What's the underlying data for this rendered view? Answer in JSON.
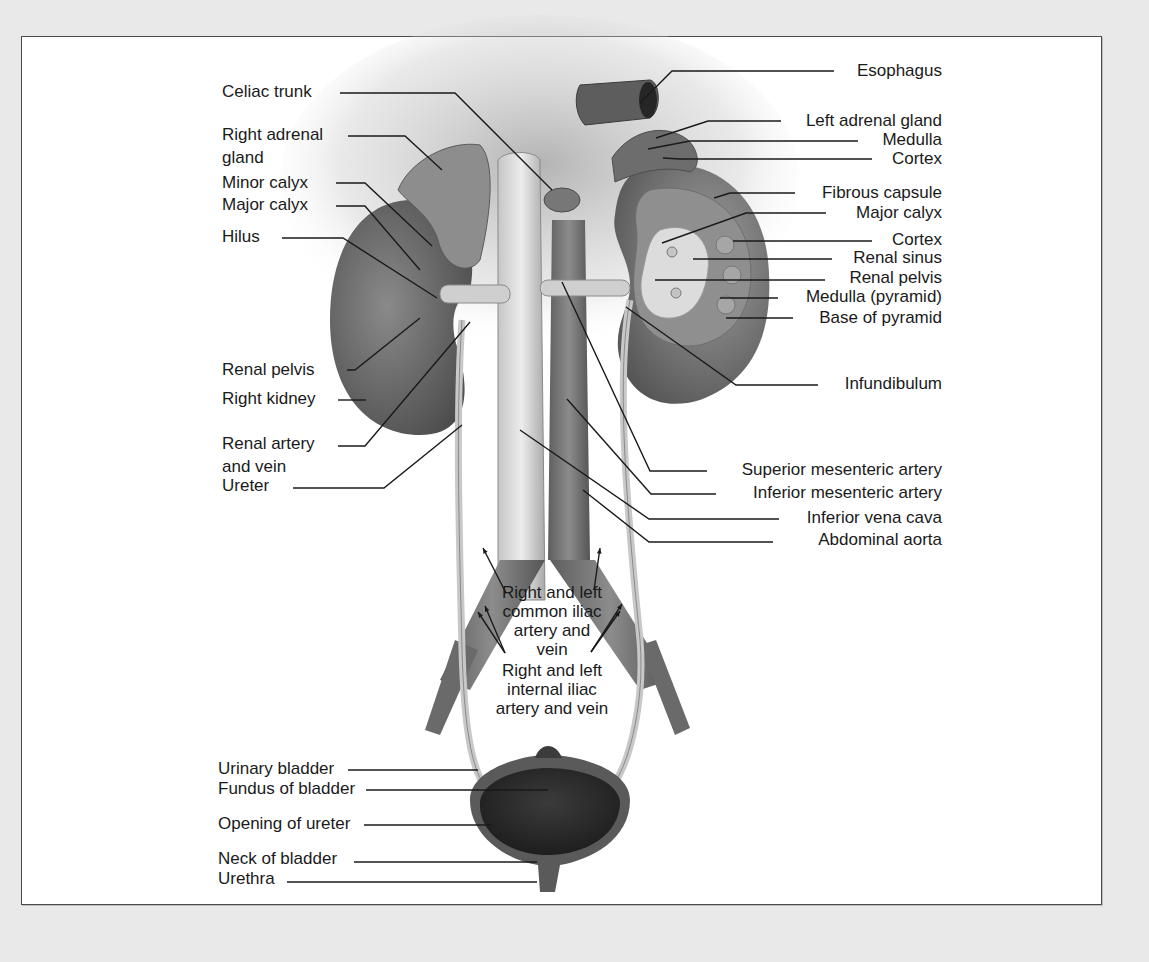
{
  "figure": {
    "colors": {
      "page_bg": "#e9e9e9",
      "frame_bg": "#ffffff",
      "frame_border": "#4a4a4a",
      "label_text": "#1a1a1a",
      "tissue_dark": "#4b4b4b",
      "tissue_mid": "#7a7a7a",
      "tissue_light": "#b9b9b9",
      "vessel_light": "#d6d6d6",
      "bladder_dark": "#2f2f2f"
    }
  },
  "labels_left": [
    {
      "id": "celiac-trunk",
      "text": "Celiac trunk",
      "x": 222,
      "y": 97,
      "line": [
        [
          340,
          93
        ],
        [
          455,
          93
        ],
        [
          552,
          190
        ]
      ]
    },
    {
      "id": "right-adrenal-gland",
      "text": "Right adrenal",
      "text2": "gland",
      "x": 222,
      "y": 140,
      "line": [
        [
          348,
          136
        ],
        [
          405,
          136
        ],
        [
          442,
          170
        ]
      ]
    },
    {
      "id": "minor-calyx",
      "text": "Minor calyx",
      "x": 222,
      "y": 188,
      "line": [
        [
          336,
          183
        ],
        [
          365,
          183
        ],
        [
          432,
          246
        ]
      ]
    },
    {
      "id": "major-calyx-right",
      "text": "Major calyx",
      "x": 222,
      "y": 210,
      "line": [
        [
          336,
          206
        ],
        [
          365,
          206
        ],
        [
          420,
          270
        ]
      ]
    },
    {
      "id": "hilus",
      "text": "Hilus",
      "x": 222,
      "y": 242,
      "line": [
        [
          282,
          238
        ],
        [
          343,
          238
        ],
        [
          437,
          298
        ]
      ]
    },
    {
      "id": "renal-pelvis-right",
      "text": "Renal pelvis",
      "x": 222,
      "y": 375,
      "line": [
        [
          347,
          370
        ],
        [
          355,
          370
        ],
        [
          420,
          318
        ]
      ]
    },
    {
      "id": "right-kidney",
      "text": "Right kidney",
      "x": 222,
      "y": 404,
      "line": [
        [
          338,
          400
        ],
        [
          366,
          400
        ]
      ]
    },
    {
      "id": "renal-artery-and-vein",
      "text": "Renal artery",
      "text2": "and vein",
      "x": 222,
      "y": 449,
      "line": [
        [
          338,
          446
        ],
        [
          365,
          446
        ],
        [
          470,
          322
        ]
      ]
    },
    {
      "id": "ureter",
      "text": "Ureter",
      "x": 222,
      "y": 491,
      "line": [
        [
          293,
          488
        ],
        [
          384,
          488
        ],
        [
          462,
          425
        ]
      ]
    }
  ],
  "labels_right": [
    {
      "id": "esophagus",
      "text": "Esophagus",
      "x": 942,
      "y": 76,
      "line": [
        [
          834,
          71
        ],
        [
          672,
          71
        ],
        [
          640,
          103
        ]
      ]
    },
    {
      "id": "left-adrenal-gland",
      "text": "Left adrenal gland",
      "x": 942,
      "y": 126,
      "line": [
        [
          781,
          121
        ],
        [
          708,
          121
        ],
        [
          656,
          138
        ]
      ]
    },
    {
      "id": "medulla-adrenal",
      "text": "Medulla",
      "x": 942,
      "y": 145,
      "line": [
        [
          858,
          141
        ],
        [
          690,
          141
        ],
        [
          648,
          149
        ]
      ]
    },
    {
      "id": "cortex-adrenal",
      "text": "Cortex",
      "x": 942,
      "y": 164,
      "line": [
        [
          872,
          159
        ],
        [
          680,
          159
        ],
        [
          663,
          158
        ]
      ]
    },
    {
      "id": "fibrous-capsule",
      "text": "Fibrous capsule",
      "x": 942,
      "y": 198,
      "line": [
        [
          795,
          193
        ],
        [
          730,
          193
        ],
        [
          714,
          198
        ]
      ]
    },
    {
      "id": "major-calyx-left",
      "text": "Major calyx",
      "x": 942,
      "y": 218,
      "line": [
        [
          826,
          213
        ],
        [
          746,
          213
        ],
        [
          662,
          243
        ]
      ]
    },
    {
      "id": "cortex-kidney",
      "text": "Cortex",
      "x": 942,
      "y": 245,
      "line": [
        [
          872,
          241
        ],
        [
          733,
          241
        ]
      ]
    },
    {
      "id": "renal-sinus",
      "text": "Renal sinus",
      "x": 942,
      "y": 263,
      "line": [
        [
          832,
          259
        ],
        [
          693,
          259
        ]
      ]
    },
    {
      "id": "renal-pelvis-left",
      "text": "Renal pelvis",
      "x": 942,
      "y": 283,
      "line": [
        [
          825,
          280
        ],
        [
          655,
          280
        ]
      ]
    },
    {
      "id": "medulla-pyramid",
      "text": "Medulla (pyramid)",
      "x": 942,
      "y": 302,
      "line": [
        [
          778,
          298
        ],
        [
          720,
          298
        ]
      ]
    },
    {
      "id": "base-of-pyramid",
      "text": "Base of pyramid",
      "x": 942,
      "y": 323,
      "line": [
        [
          793,
          318
        ],
        [
          726,
          318
        ]
      ]
    },
    {
      "id": "infundibulum",
      "text": "Infundibulum",
      "x": 942,
      "y": 389,
      "line": [
        [
          818,
          385
        ],
        [
          736,
          385
        ],
        [
          626,
          307
        ]
      ]
    },
    {
      "id": "superior-mesenteric-artery",
      "text": "Superior mesenteric artery",
      "x": 942,
      "y": 475,
      "line": [
        [
          707,
          471
        ],
        [
          650,
          471
        ],
        [
          562,
          282
        ]
      ]
    },
    {
      "id": "inferior-mesenteric-artery",
      "text": "Inferior mesenteric artery",
      "x": 942,
      "y": 498,
      "line": [
        [
          716,
          494
        ],
        [
          651,
          494
        ],
        [
          567,
          399
        ]
      ]
    },
    {
      "id": "inferior-vena-cava",
      "text": "Inferior vena cava",
      "x": 942,
      "y": 523,
      "line": [
        [
          779,
          519
        ],
        [
          649,
          519
        ],
        [
          520,
          430
        ]
      ]
    },
    {
      "id": "abdominal-aorta",
      "text": "Abdominal aorta",
      "x": 942,
      "y": 545,
      "line": [
        [
          773,
          542
        ],
        [
          649,
          542
        ],
        [
          583,
          490
        ]
      ]
    }
  ],
  "labels_center": [
    {
      "id": "common-iliac",
      "lines": [
        "Right and left",
        "common iliac",
        "artery and",
        "vein"
      ],
      "x": 552,
      "y": 598,
      "arrows": [
        [
          [
            506,
            593
          ],
          [
            483,
            548
          ]
        ],
        [
          [
            594,
            590
          ],
          [
            600,
            548
          ]
        ]
      ]
    },
    {
      "id": "internal-iliac",
      "lines": [
        "Right and left",
        "internal iliac",
        "artery and vein"
      ],
      "x": 552,
      "y": 676,
      "arrows": [
        [
          [
            505,
            653
          ],
          [
            478,
            612
          ]
        ],
        [
          [
            505,
            653
          ],
          [
            485,
            606
          ]
        ],
        [
          [
            591,
            652
          ],
          [
            620,
            611
          ]
        ],
        [
          [
            591,
            652
          ],
          [
            622,
            604
          ]
        ]
      ]
    }
  ],
  "labels_bladder": [
    {
      "id": "urinary-bladder",
      "text": "Urinary bladder",
      "x": 218,
      "y": 774,
      "line": [
        [
          348,
          770
        ],
        [
          478,
          770
        ]
      ]
    },
    {
      "id": "fundus-of-bladder",
      "text": "Fundus of bladder",
      "x": 218,
      "y": 794,
      "line": [
        [
          366,
          790
        ],
        [
          548,
          790
        ]
      ]
    },
    {
      "id": "opening-of-ureter",
      "text": "Opening of ureter",
      "x": 218,
      "y": 829,
      "line": [
        [
          364,
          825
        ],
        [
          492,
          825
        ]
      ]
    },
    {
      "id": "neck-of-bladder",
      "text": "Neck of bladder",
      "x": 218,
      "y": 864,
      "line": [
        [
          354,
          862
        ],
        [
          537,
          862
        ]
      ]
    },
    {
      "id": "urethra",
      "text": "Urethra",
      "x": 218,
      "y": 884,
      "line": [
        [
          287,
          882
        ],
        [
          537,
          882
        ]
      ]
    }
  ]
}
